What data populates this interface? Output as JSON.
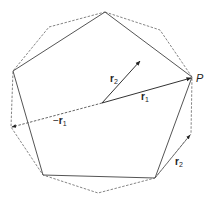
{
  "diagram": {
    "colors": {
      "solid_line": "#555555",
      "dashed_line": "#777777",
      "arrow": "#333333"
    },
    "labels": {
      "point_P": "P",
      "r1": "r",
      "r1_sub": "1",
      "neg_r1_sign": "−",
      "neg_r1": "r",
      "neg_r1_sub": "1",
      "r2_center": "r",
      "r2_center_sub": "2",
      "r2_edge": "r",
      "r2_edge_sub": "2"
    }
  }
}
